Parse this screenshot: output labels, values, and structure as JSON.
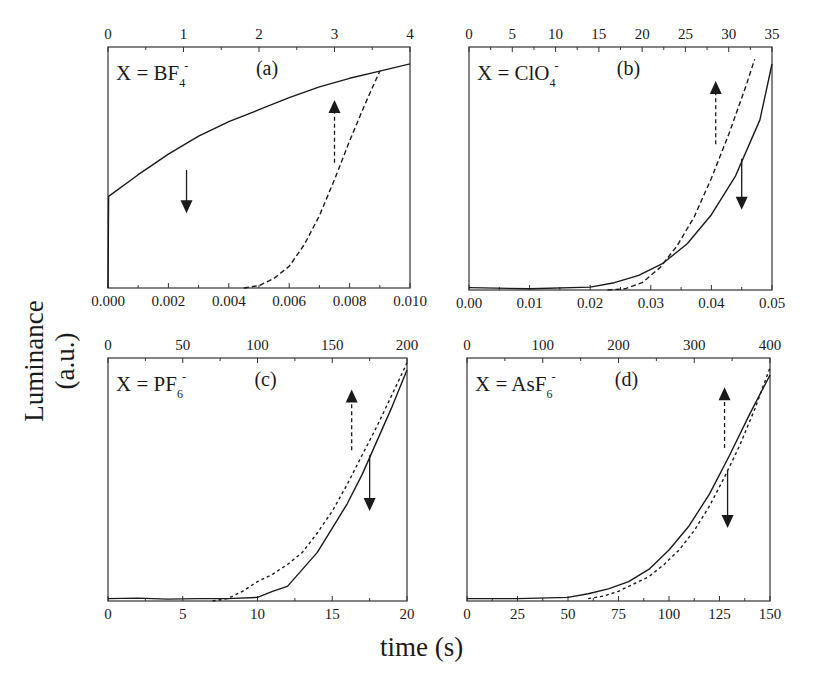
{
  "figure": {
    "ylabel": "Luminance (a.u.)",
    "xlabel": "time (s)"
  },
  "chart_data": [
    {
      "type": "line",
      "panel": "(a)",
      "annotation": "X = BF",
      "ion_sub": "4",
      "ion_sup": "-",
      "frame": [
        108,
        47,
        410,
        288
      ],
      "xlim": [
        0,
        0.01
      ],
      "xticks": [
        "0.000",
        "0.002",
        "0.004",
        "0.006",
        "0.008",
        "0.010"
      ],
      "x2lim": [
        0,
        4
      ],
      "x2ticks": [
        "0",
        "1",
        "2",
        "3",
        "4"
      ],
      "ylim": [
        0,
        1
      ],
      "series": [
        {
          "name": "solid (bottom axis)",
          "style": "solid",
          "arrow": "down",
          "x": [
            0,
            2e-05,
            0.001,
            0.002,
            0.003,
            0.004,
            0.005,
            0.006,
            0.007,
            0.008,
            0.009,
            0.01
          ],
          "y": [
            0,
            0.38,
            0.47,
            0.555,
            0.63,
            0.69,
            0.74,
            0.79,
            0.835,
            0.87,
            0.9,
            0.93
          ]
        },
        {
          "name": "dashed (top axis)",
          "style": "dashed",
          "arrow": "up",
          "x": [
            1.8,
            2.0,
            2.2,
            2.4,
            2.6,
            2.8,
            3.0,
            3.2,
            3.4,
            3.6
          ],
          "y": [
            0,
            0.01,
            0.04,
            0.09,
            0.18,
            0.3,
            0.45,
            0.61,
            0.76,
            0.9
          ]
        }
      ],
      "arrows": [
        {
          "x": 0.0026,
          "y0": 0.49,
          "y1": 0.31,
          "dir": "down",
          "style": "solid"
        },
        {
          "x2": 3.0,
          "y0": 0.52,
          "y1": 0.78,
          "dir": "up",
          "style": "dashed"
        }
      ]
    },
    {
      "type": "line",
      "panel": "(b)",
      "annotation": "X = ClO",
      "ion_sub": "4",
      "ion_sup": "-",
      "frame": [
        469,
        47,
        772,
        290
      ],
      "xlim": [
        0,
        0.05
      ],
      "xticks": [
        "0.00",
        "0.01",
        "0.02",
        "0.03",
        "0.04",
        "0.05"
      ],
      "x2lim": [
        0,
        35
      ],
      "x2ticks": [
        "0",
        "5",
        "10",
        "15",
        "20",
        "25",
        "30",
        "35"
      ],
      "ylim": [
        0,
        1
      ],
      "series": [
        {
          "name": "solid (bottom axis)",
          "style": "solid",
          "arrow": "down",
          "x": [
            0,
            0.01,
            0.02,
            0.024,
            0.028,
            0.032,
            0.036,
            0.04,
            0.044,
            0.048,
            0.05
          ],
          "y": [
            0.01,
            0.005,
            0.012,
            0.03,
            0.06,
            0.11,
            0.19,
            0.31,
            0.47,
            0.7,
            0.93
          ]
        },
        {
          "name": "dashed (top axis)",
          "style": "dashed",
          "arrow": "up",
          "x": [
            16,
            18,
            20,
            22,
            24,
            26,
            28,
            30,
            32,
            33
          ],
          "y": [
            0.0,
            0.005,
            0.03,
            0.09,
            0.18,
            0.3,
            0.46,
            0.64,
            0.84,
            0.95
          ]
        }
      ],
      "arrows": [
        {
          "x": 0.045,
          "y0": 0.54,
          "y1": 0.33,
          "dir": "down",
          "style": "solid"
        },
        {
          "x2": 28.5,
          "y0": 0.6,
          "y1": 0.86,
          "dir": "up",
          "style": "dashed"
        }
      ]
    },
    {
      "type": "line",
      "panel": "(c)",
      "annotation": "X = PF",
      "ion_sub": "6",
      "ion_sup": "-",
      "frame": [
        108,
        358,
        407,
        601
      ],
      "xlim": [
        0,
        20
      ],
      "xticks": [
        "0",
        "5",
        "10",
        "15",
        "20"
      ],
      "x2lim": [
        0,
        200
      ],
      "x2ticks": [
        "0",
        "50",
        "100",
        "150",
        "200"
      ],
      "ylim": [
        0,
        1
      ],
      "series": [
        {
          "name": "solid (bottom axis)",
          "style": "solid",
          "arrow": "down",
          "x": [
            0,
            2,
            4,
            6,
            8,
            10,
            11,
            12,
            13,
            14,
            15,
            16,
            17,
            18,
            19,
            20
          ],
          "y": [
            0.01,
            0.012,
            0.008,
            0.01,
            0.01,
            0.015,
            0.04,
            0.06,
            0.13,
            0.2,
            0.3,
            0.4,
            0.52,
            0.66,
            0.8,
            0.95
          ]
        },
        {
          "name": "dotted (top axis)",
          "style": "dotted",
          "arrow": "up",
          "x": [
            70,
            80,
            90,
            100,
            110,
            120,
            130,
            140,
            150,
            160,
            170,
            180,
            190,
            200
          ],
          "y": [
            0.0,
            0.01,
            0.04,
            0.08,
            0.11,
            0.15,
            0.2,
            0.28,
            0.37,
            0.48,
            0.6,
            0.72,
            0.85,
            0.98
          ]
        }
      ],
      "arrows": [
        {
          "x": 17.5,
          "y0": 0.6,
          "y1": 0.37,
          "dir": "down",
          "style": "solid"
        },
        {
          "x2": 163,
          "y0": 0.62,
          "y1": 0.87,
          "dir": "up",
          "style": "dashed"
        }
      ]
    },
    {
      "type": "line",
      "panel": "(d)",
      "annotation": "X = AsF",
      "ion_sub": "6",
      "ion_sup": "-",
      "frame": [
        467,
        358,
        770,
        601
      ],
      "xlim": [
        0,
        150
      ],
      "xticks": [
        "0",
        "25",
        "50",
        "75",
        "100",
        "125",
        "150"
      ],
      "x2lim": [
        0,
        400
      ],
      "x2ticks": [
        "0",
        "100",
        "200",
        "300",
        "400"
      ],
      "ylim": [
        0,
        1
      ],
      "series": [
        {
          "name": "solid (bottom axis)",
          "style": "solid",
          "arrow": "down",
          "x": [
            0,
            25,
            50,
            60,
            70,
            80,
            90,
            100,
            110,
            120,
            130,
            140,
            150
          ],
          "y": [
            0.01,
            0.01,
            0.015,
            0.03,
            0.05,
            0.08,
            0.13,
            0.21,
            0.31,
            0.44,
            0.6,
            0.77,
            0.93
          ]
        },
        {
          "name": "dotted (top axis)",
          "style": "dotted",
          "arrow": "up",
          "x": [
            160,
            180,
            200,
            220,
            240,
            260,
            280,
            300,
            320,
            340,
            360,
            380,
            400
          ],
          "y": [
            0.01,
            0.02,
            0.04,
            0.07,
            0.1,
            0.15,
            0.21,
            0.29,
            0.39,
            0.51,
            0.64,
            0.79,
            0.96
          ]
        }
      ],
      "arrows": [
        {
          "x": 129,
          "y0": 0.54,
          "y1": 0.3,
          "dir": "down",
          "style": "solid"
        },
        {
          "x2": 340,
          "y0": 0.63,
          "y1": 0.88,
          "dir": "up",
          "style": "dashed"
        }
      ]
    }
  ]
}
